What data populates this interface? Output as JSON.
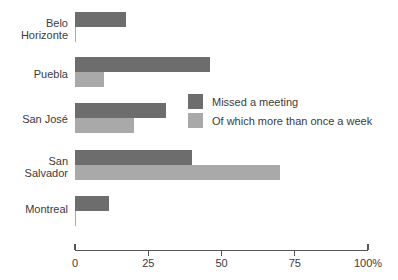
{
  "chart_data": {
    "type": "bar",
    "orientation": "horizontal",
    "title": "",
    "xlabel": "",
    "ylabel": "",
    "xlim": [
      0,
      100
    ],
    "grid": false,
    "legend_position": "inside-center-right",
    "categories": [
      "Belo Horizonte",
      "Puebla",
      "San José",
      "San Salvador",
      "Montreal"
    ],
    "series": [
      {
        "name": "Missed a meeting",
        "color": "#6d6d6d",
        "values": [
          17.5,
          46,
          31,
          40,
          11.5
        ]
      },
      {
        "name": "Of which more than once a week",
        "color": "#a9a9a9",
        "values": [
          0.5,
          10,
          20,
          70,
          0.5
        ]
      }
    ],
    "xticks": [
      0,
      25,
      50,
      75,
      100
    ],
    "xticklabels": [
      "0",
      "25",
      "50",
      "75",
      "100%"
    ]
  },
  "axis": {
    "ticks": [
      {
        "value": 0,
        "label": "0",
        "style": "up"
      },
      {
        "value": 25,
        "label": "25",
        "style": "down"
      },
      {
        "value": 50,
        "label": "50",
        "style": "down"
      },
      {
        "value": 75,
        "label": "75",
        "style": "down"
      },
      {
        "value": 100,
        "label": "100%",
        "style": "up"
      }
    ]
  },
  "categories": [
    {
      "label": "Belo\nHorizonte"
    },
    {
      "label": "Puebla"
    },
    {
      "label": "San José"
    },
    {
      "label": "San\nSalvador"
    },
    {
      "label": "Montreal"
    }
  ],
  "legend": {
    "items": [
      {
        "label": "Missed a meeting",
        "color": "#6d6d6d"
      },
      {
        "label": "Of which more than once a week",
        "color": "#a9a9a9"
      }
    ]
  },
  "colors": {
    "dark": "#6d6d6d",
    "light": "#a9a9a9",
    "axis": "#555555",
    "text": "#3b3b3b",
    "background": "#ffffff"
  }
}
